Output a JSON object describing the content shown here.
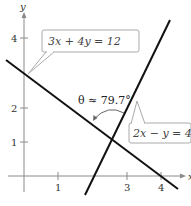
{
  "diagram": {
    "axes": {
      "x_label": "x",
      "y_label": "y",
      "x_ticks": [
        {
          "value": 1,
          "label": "1"
        },
        {
          "value": 3,
          "label": "3"
        },
        {
          "value": 4,
          "label": "4"
        }
      ],
      "y_ticks": [
        {
          "value": 1,
          "label": "1"
        },
        {
          "value": 2,
          "label": "2"
        },
        {
          "value": 4,
          "label": "4"
        }
      ]
    },
    "lines": [
      {
        "equation": "3x + 4y = 12",
        "label": "3x + 4y = 12"
      },
      {
        "equation": "2x − y = 4",
        "label": "2x − y = 4"
      }
    ],
    "angle": {
      "label": "θ ≈ 79.7°"
    },
    "colors": {
      "line": "#111111",
      "axis": "#888888",
      "callout_border": "#aaaaaa"
    }
  }
}
